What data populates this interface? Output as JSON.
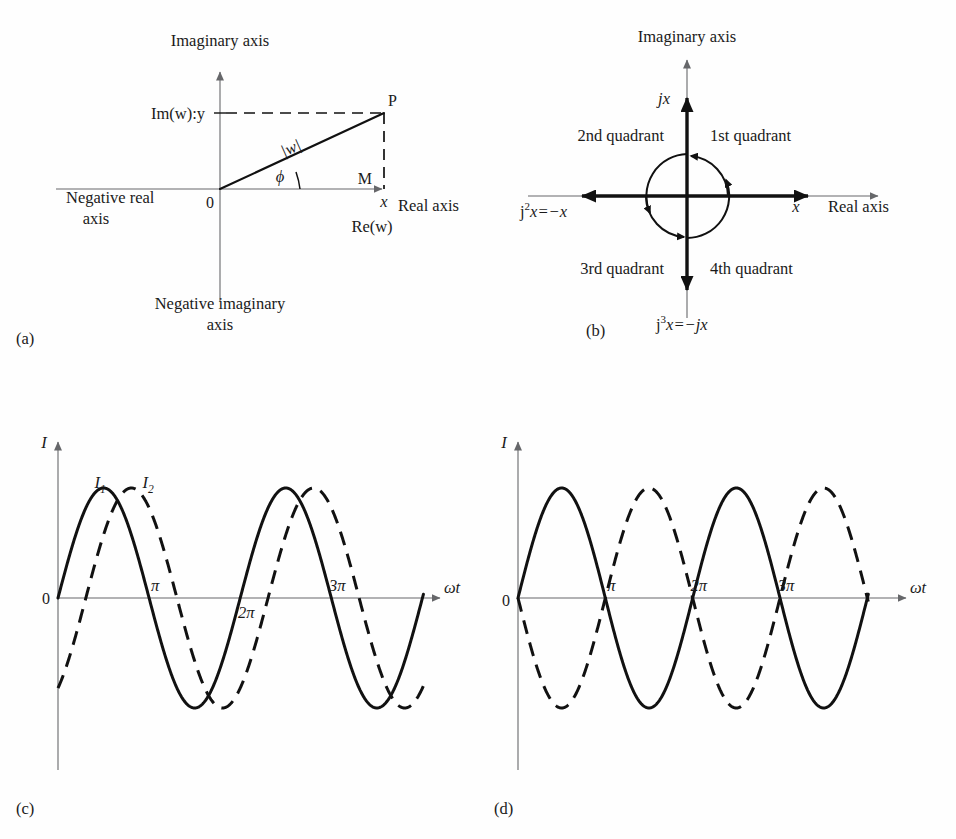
{
  "figure": {
    "background": "#fefefe",
    "ink": "#111111",
    "axis_gray": "#66676a"
  },
  "panels": [
    {
      "tag": "(a)",
      "name": "argand-diagram",
      "caption_labels": {
        "imaginary_axis": "Imaginary axis",
        "real_axis": "Real axis",
        "negative_real_axis_line1": "Negative real",
        "negative_real_axis_line2": "axis",
        "negative_imaginary_axis_line1": "Negative imaginary",
        "negative_imaginary_axis_line2": "axis",
        "origin": "0",
        "point_p": "P",
        "point_m": "M",
        "imaginary_part": "Im(w):y",
        "real_part": "Re(w)",
        "x_value": "x",
        "modulus": "|w|",
        "angle": "ϕ"
      }
    },
    {
      "tag": "(b)",
      "name": "j-operator-rotation-diagram",
      "caption_labels": {
        "imaginary_axis": "Imaginary axis",
        "real_axis": "Real axis",
        "jx": "jx",
        "x_value": "x",
        "j_squared": "x=−x",
        "j_squared_base": "j",
        "j_squared_exp": "2",
        "j_cubed": "x=−jx",
        "j_cubed_base": "j",
        "j_cubed_exp": "3",
        "quadrant_1": "1st quadrant",
        "quadrant_2": "2nd quadrant",
        "quadrant_3": "3rd quadrant",
        "quadrant_4": "4th quadrant"
      }
    },
    {
      "tag": "(c)",
      "name": "out-of-phase-waveforms",
      "caption_labels": {
        "y_axis": "I",
        "x_axis": "ωt",
        "origin": "0",
        "series_1": "I",
        "series_1_sub": "1",
        "series_2": "I",
        "series_2_sub": "2",
        "tick_pi": "π",
        "tick_2pi": "2π",
        "tick_3pi": "3π"
      }
    },
    {
      "tag": "(d)",
      "name": "antiphase-waveforms",
      "caption_labels": {
        "y_axis": "I",
        "x_axis": "ωt",
        "origin": "0",
        "tick_pi": "π",
        "tick_2pi": "2π",
        "tick_3pi": "3π"
      }
    }
  ],
  "chart_data": [
    {
      "type": "line",
      "panel": "(c)",
      "title": "Two sinusoidal currents out of phase",
      "xlabel": "ωt",
      "ylabel": "I",
      "xlim": [
        0,
        13.2
      ],
      "ylim": [
        -1.15,
        1.15
      ],
      "grid": false,
      "legend": "inline-at-first-peak",
      "xticks": [
        3.14159,
        6.28319,
        9.42478
      ],
      "xticklabels": [
        "π",
        "2π",
        "3π"
      ],
      "series": [
        {
          "name": "I1",
          "label": "I₁",
          "style": "solid",
          "amplitude": 1.0,
          "period": 6.28319,
          "phase_deg": 0,
          "formula": "sin(ωt)"
        },
        {
          "name": "I2",
          "label": "I₂",
          "style": "dashed",
          "amplitude": 1.0,
          "period": 6.28319,
          "phase_deg": -55,
          "formula": "sin(ωt − 55°)"
        }
      ]
    },
    {
      "type": "line",
      "panel": "(d)",
      "title": "Two sinusoidal currents in antiphase",
      "xlabel": "ωt",
      "ylabel": "I",
      "xlim": [
        0,
        13.2
      ],
      "ylim": [
        -1.15,
        1.15
      ],
      "grid": false,
      "legend": "none",
      "xticks": [
        3.14159,
        6.28319,
        9.42478
      ],
      "xticklabels": [
        "π",
        "2π",
        "3π"
      ],
      "series": [
        {
          "name": "I1",
          "label": "I₁",
          "style": "solid",
          "amplitude": 1.0,
          "period": 6.28319,
          "phase_deg": 0,
          "formula": "sin(ωt)"
        },
        {
          "name": "I2",
          "label": "I₂",
          "style": "dashed",
          "amplitude": 1.0,
          "period": 6.28319,
          "phase_deg": 180,
          "formula": "−sin(ωt)"
        }
      ]
    }
  ]
}
